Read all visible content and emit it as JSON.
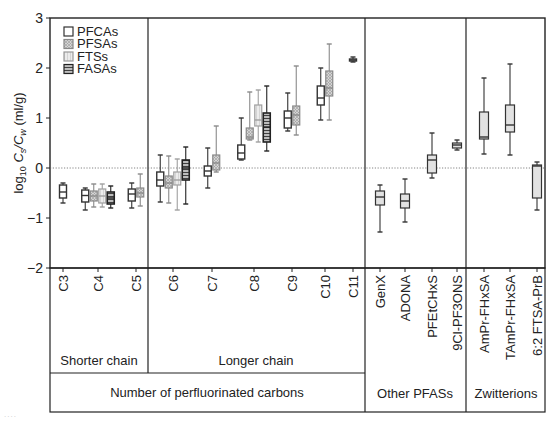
{
  "chart_data": {
    "type": "box",
    "title": "",
    "ylabel": "log10 Cs/Cw (ml/g)",
    "ylabel_parts": {
      "pre": "log",
      "sub1": "10",
      "c": "C",
      "sub_s": "s",
      "slash": "/C",
      "sub_w": "w",
      "unit": " (ml/g)"
    },
    "ylim": [
      -2,
      3
    ],
    "yticks": [
      -2,
      -1,
      0,
      1,
      2,
      3
    ],
    "ytick_labels": [
      "−2",
      "−1",
      "0",
      "1",
      "2",
      "3"
    ],
    "reference_line": {
      "y": 0,
      "style": "dotted"
    },
    "legend": {
      "position": "upper-left",
      "entries": [
        {
          "name": "PFCAs",
          "fill": "#ffffff",
          "pattern": "none",
          "stroke": "#333333"
        },
        {
          "name": "PFSAs",
          "fill": "#c8c8c8",
          "pattern": "crosshatch",
          "stroke": "#888888"
        },
        {
          "name": "FTSs",
          "fill": "#e6e6e6",
          "pattern": "vertical",
          "stroke": "#999999"
        },
        {
          "name": "FASAs",
          "fill": "#9a9a9a",
          "pattern": "horizontal",
          "stroke": "#222222"
        }
      ]
    },
    "categories": [
      "C3",
      "C4",
      "C5",
      "C6",
      "C7",
      "C8",
      "C9",
      "C10",
      "C11",
      "GenX",
      "ADONA",
      "PFEtCHxS",
      "9Cl-PF3ONS",
      "AmPr-FHxSA",
      "TAmPr-FHxSA",
      "6:2 FTSA-PrB"
    ],
    "series": [
      {
        "name": "PFCAs",
        "boxes": [
          {
            "cat": "C3",
            "min": -0.7,
            "q1": -0.6,
            "median": -0.48,
            "q3": -0.34,
            "max": -0.3
          },
          {
            "cat": "C4",
            "min": -0.84,
            "q1": -0.68,
            "median": -0.55,
            "q3": -0.44,
            "max": -0.4
          },
          {
            "cat": "C5",
            "min": -0.8,
            "q1": -0.66,
            "median": -0.52,
            "q3": -0.42,
            "max": -0.3
          },
          {
            "cat": "C6",
            "min": -0.68,
            "q1": -0.36,
            "median": -0.24,
            "q3": -0.08,
            "max": 0.26
          },
          {
            "cat": "C7",
            "min": -0.4,
            "q1": -0.16,
            "median": -0.06,
            "q3": 0.04,
            "max": 0.4
          },
          {
            "cat": "C8",
            "min": 0.16,
            "q1": 0.18,
            "median": 0.3,
            "q3": 0.46,
            "max": 1.0
          },
          {
            "cat": "C9",
            "min": 0.74,
            "q1": 0.8,
            "median": 1.0,
            "q3": 1.14,
            "max": 1.5
          },
          {
            "cat": "C10",
            "min": 0.96,
            "q1": 1.26,
            "median": 1.4,
            "q3": 1.64,
            "max": 2.0
          },
          {
            "cat": "C11",
            "min": 2.12,
            "q1": 2.14,
            "median": 2.16,
            "q3": 2.18,
            "max": 2.22
          }
        ]
      },
      {
        "name": "PFSAs",
        "boxes": [
          {
            "cat": "C4",
            "min": -0.78,
            "q1": -0.66,
            "median": -0.56,
            "q3": -0.46,
            "max": -0.32
          },
          {
            "cat": "C5",
            "min": -0.76,
            "q1": -0.58,
            "median": -0.5,
            "q3": -0.4,
            "max": -0.12
          },
          {
            "cat": "C6",
            "min": -0.7,
            "q1": -0.4,
            "median": -0.3,
            "q3": -0.16,
            "max": 0.24
          },
          {
            "cat": "C7",
            "min": -0.08,
            "q1": -0.04,
            "median": 0.1,
            "q3": 0.26,
            "max": 0.84
          },
          {
            "cat": "C8",
            "min": 0.56,
            "q1": 0.58,
            "median": 0.62,
            "q3": 0.8,
            "max": 1.52
          },
          {
            "cat": "C9",
            "min": 0.66,
            "q1": 0.86,
            "median": 1.06,
            "q3": 1.24,
            "max": 2.04
          },
          {
            "cat": "C10",
            "min": 0.96,
            "q1": 1.44,
            "median": 1.6,
            "q3": 1.94,
            "max": 2.48
          }
        ]
      },
      {
        "name": "FTSs",
        "boxes": [
          {
            "cat": "C4",
            "min": -0.78,
            "q1": -0.7,
            "median": -0.56,
            "q3": -0.42,
            "max": -0.32
          },
          {
            "cat": "C6",
            "min": -0.84,
            "q1": -0.34,
            "median": -0.24,
            "q3": -0.08,
            "max": 0.18
          },
          {
            "cat": "C8",
            "min": 0.52,
            "q1": 0.84,
            "median": 0.96,
            "q3": 1.26,
            "max": 1.56
          }
        ]
      },
      {
        "name": "FASAs",
        "boxes": [
          {
            "cat": "C4",
            "min": -0.8,
            "q1": -0.72,
            "median": -0.6,
            "q3": -0.48,
            "max": -0.36
          },
          {
            "cat": "C6",
            "min": -0.72,
            "q1": -0.24,
            "median": 0.0,
            "q3": 0.16,
            "max": 0.42
          },
          {
            "cat": "C8",
            "min": 0.34,
            "q1": 0.52,
            "median": 0.82,
            "q3": 1.1,
            "max": 1.64
          }
        ]
      },
      {
        "name": "Other",
        "boxes": [
          {
            "cat": "GenX",
            "min": -1.28,
            "q1": -0.74,
            "median": -0.58,
            "q3": -0.46,
            "max": -0.34
          },
          {
            "cat": "ADONA",
            "min": -1.08,
            "q1": -0.8,
            "median": -0.66,
            "q3": -0.52,
            "max": -0.22
          },
          {
            "cat": "PFEtCHxS",
            "min": -0.2,
            "q1": -0.1,
            "median": 0.16,
            "q3": 0.26,
            "max": 0.7
          },
          {
            "cat": "9Cl-PF3ONS",
            "min": 0.36,
            "q1": 0.4,
            "median": 0.46,
            "q3": 0.5,
            "max": 0.56
          }
        ]
      },
      {
        "name": "Zwitterions",
        "boxes": [
          {
            "cat": "AmPr-FHxSA",
            "min": 0.28,
            "q1": 0.58,
            "median": 0.62,
            "q3": 1.12,
            "max": 1.8
          },
          {
            "cat": "TAmPr-FHxSA",
            "min": 0.26,
            "q1": 0.72,
            "median": 0.86,
            "q3": 1.26,
            "max": 2.08
          },
          {
            "cat": "6:2 FTSA-PrB",
            "min": -0.84,
            "q1": -0.6,
            "median": 0.04,
            "q3": 0.06,
            "max": 0.12
          }
        ]
      }
    ],
    "group_labels": {
      "shorter_chain": "Shorter chain",
      "longer_chain": "Longer chain",
      "perfluorinated": "Number of perfluorinated carbons",
      "other": "Other PFASs",
      "zwitterions": "Zwitterions"
    },
    "grid": false
  },
  "footer_ghost": "...."
}
